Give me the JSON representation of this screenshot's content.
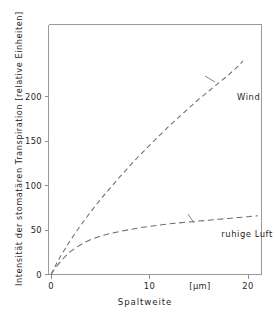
{
  "chart_data": {
    "type": "line",
    "title": "",
    "xlabel": "Spaltweite",
    "xunit": "[µm]",
    "ylabel": "Intensität der stomatären Transpiration [relative Einheiten]",
    "xlim": [
      0,
      21.6
    ],
    "ylim": [
      0,
      252
    ],
    "xticks": [
      0,
      10,
      20
    ],
    "xticklabels": [
      "0",
      "10",
      "20"
    ],
    "yticks": [
      0,
      50,
      100,
      150,
      200
    ],
    "yticklabels": [
      "0",
      "50",
      "100",
      "150",
      "200"
    ],
    "grid": false,
    "legend_position": "inline-annotations",
    "series": [
      {
        "name": "Wind",
        "label": "Wind",
        "style": "dashed",
        "color": "#6e6e6e",
        "x": [
          0,
          0.5,
          1,
          1.5,
          2,
          3,
          4,
          5,
          6,
          7,
          8,
          9,
          10,
          11,
          12,
          13,
          14,
          15,
          16,
          17,
          18,
          19,
          19.5
        ],
        "y": [
          0,
          11,
          21,
          30,
          39,
          55,
          70,
          84,
          97,
          110,
          122,
          134,
          145,
          156,
          167,
          177,
          187,
          197,
          206,
          215,
          224,
          234,
          240
        ]
      },
      {
        "name": "ruhige Luft",
        "label": "ruhige Luft",
        "style": "dashed",
        "color": "#6e6e6e",
        "x": [
          0,
          0.5,
          1,
          1.5,
          2,
          2.5,
          3,
          3.5,
          4,
          5,
          6,
          7,
          8,
          9,
          10,
          11,
          12,
          13,
          14,
          15,
          16,
          17,
          18,
          19,
          20,
          21
        ],
        "y": [
          0,
          8,
          15,
          21,
          26,
          30,
          33.5,
          36.5,
          39,
          43,
          46,
          48.5,
          50.5,
          52.5,
          54,
          55.5,
          57,
          58,
          59,
          60,
          61,
          62,
          63,
          64,
          65,
          66
        ]
      }
    ],
    "annotations": [
      {
        "text": "Wind",
        "x": 19.2,
        "y": 200
      },
      {
        "text": "ruhige Luft",
        "x": 18.3,
        "y": 45
      }
    ]
  },
  "axes": {
    "x_tick_0": "0",
    "x_tick_10": "10",
    "x_tick_20": "20",
    "x_unit": "[µm]",
    "x_title": "Spaltweite",
    "y_tick_0": "0",
    "y_tick_50": "50",
    "y_tick_100": "100",
    "y_tick_150": "150",
    "y_tick_200": "200",
    "y_title": "Intensität der stomatären Transpiration [relative Einheiten]"
  },
  "series_labels": {
    "wind": "Wind",
    "still_air": "ruhige Luft"
  },
  "colors": {
    "curve": "#6e6e6e",
    "frame": "#9a9a9a",
    "text": "#1f1f1f",
    "background": "#ffffff"
  }
}
